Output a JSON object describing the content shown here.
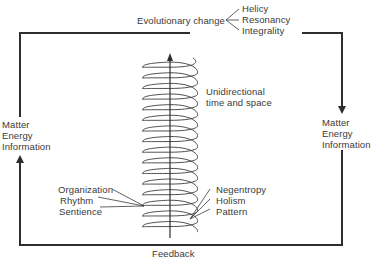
{
  "diagram": {
    "top": {
      "main_label": "Evolutionary change",
      "branches": [
        "Helicy",
        "Resonancy",
        "Integrality"
      ]
    },
    "left_input": [
      "Matter",
      "Energy",
      "Information"
    ],
    "right_output": [
      "Matter",
      "Energy",
      "Information"
    ],
    "helix_label": [
      "Unidirectional",
      "time and space"
    ],
    "left_attributes": [
      "Organization",
      "Rhythm",
      "Sentience"
    ],
    "right_attributes": [
      "Negentropy",
      "Holism",
      "Pattern"
    ],
    "bottom_label": "Feedback",
    "colors": {
      "line": "#2e2e2e",
      "text": "#3a3a3a",
      "background": "#ffffff"
    },
    "helix": {
      "coils": 16
    }
  }
}
